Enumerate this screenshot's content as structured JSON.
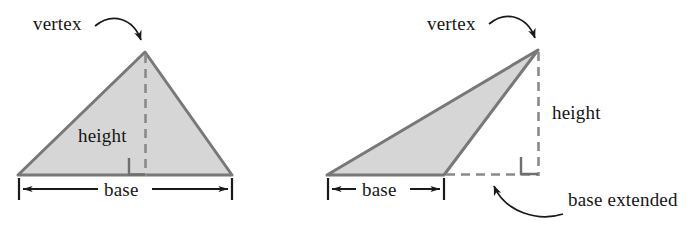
{
  "figure": {
    "colors": {
      "fill": "#d6d6d6",
      "stroke": "#787878",
      "dash": "#8a8a8a",
      "text": "#161616",
      "arrow": "#1a1a1a",
      "background": "#ffffff"
    }
  },
  "panels": [
    {
      "id": "acute-triangle",
      "labels": {
        "vertex": "vertex",
        "height": "height",
        "base": "base"
      },
      "geometry": {
        "apex": [
          145,
          52
        ],
        "base_left": [
          18,
          175
        ],
        "base_right": [
          232,
          175
        ],
        "foot": [
          145,
          175
        ],
        "height_dashed_from": [
          145,
          52
        ],
        "height_dashed_to": [
          145,
          175
        ],
        "right_angle_square": [
          129,
          158,
          16,
          17
        ],
        "dimension_line_y": 189,
        "dimension_x_from": 18,
        "dimension_x_to": 232
      },
      "annotations": {
        "vertex_text_pos": [
          33,
          14
        ],
        "height_text_pos": [
          78,
          124
        ],
        "base_text_pos": [
          104,
          180
        ],
        "vertex_arrow_from": [
          95,
          24
        ],
        "vertex_arrow_to": [
          143,
          48
        ]
      }
    },
    {
      "id": "obtuse-triangle",
      "labels": {
        "vertex": "vertex",
        "height": "height",
        "base": "base",
        "base_extended": "base extended"
      },
      "geometry": {
        "apex": [
          538,
          50
        ],
        "base_left": [
          327,
          175
        ],
        "base_right": [
          444,
          175
        ],
        "foot": [
          538,
          175
        ],
        "extended_dashed_from": [
          444,
          175
        ],
        "extended_dashed_to": [
          538,
          175
        ],
        "height_dashed_from": [
          538,
          50
        ],
        "height_dashed_to": [
          538,
          175
        ],
        "right_angle_square": [
          521,
          157,
          17,
          17
        ],
        "dimension_line_y": 189,
        "dimension_x_from": 327,
        "dimension_x_to": 444
      },
      "annotations": {
        "vertex_text_pos": [
          427,
          14
        ],
        "height_text_pos": [
          552,
          101
        ],
        "base_text_pos": [
          362,
          180
        ],
        "base_extended_text_pos": [
          568,
          189
        ],
        "vertex_arrow_from": [
          489,
          22
        ],
        "vertex_arrow_to": [
          536,
          46
        ],
        "extended_arrow_from": [
          563,
          214
        ],
        "extended_arrow_to": [
          492,
          182
        ]
      }
    }
  ]
}
